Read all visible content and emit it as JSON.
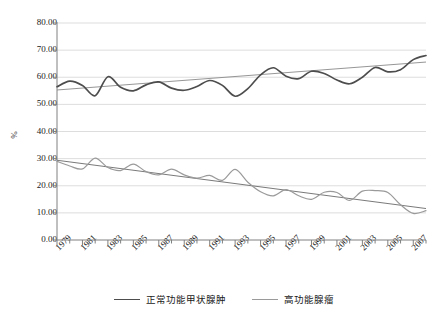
{
  "chart_data": {
    "type": "line",
    "title": "",
    "xlabel": "",
    "ylabel": "%",
    "ylim": [
      0,
      80
    ],
    "ytick_step": 10,
    "ytick_labels": [
      "0.00",
      "10.00",
      "20.00",
      "30.00",
      "40.00",
      "50.00",
      "60.00",
      "70.00",
      "80.00"
    ],
    "ytick_values": [
      0,
      10,
      20,
      30,
      40,
      50,
      60,
      70,
      80
    ],
    "xlim": [
      1979,
      2008
    ],
    "xtick_labels": [
      "1979",
      "1981",
      "1983",
      "1985",
      "1987",
      "1989",
      "1991",
      "1993",
      "1995",
      "1997",
      "1999",
      "2001",
      "2003",
      "2005",
      "2007"
    ],
    "xtick_values": [
      1979,
      1981,
      1983,
      1985,
      1987,
      1989,
      1991,
      1993,
      1995,
      1997,
      1999,
      2001,
      2003,
      2005,
      2007
    ],
    "x_minor_tick_step": 1,
    "grid": "horizontal",
    "legend_position": "bottom",
    "x": [
      1979,
      1980,
      1981,
      1982,
      1983,
      1984,
      1985,
      1986,
      1987,
      1988,
      1989,
      1990,
      1991,
      1992,
      1993,
      1994,
      1995,
      1996,
      1997,
      1998,
      1999,
      2000,
      2001,
      2002,
      2003,
      2004,
      2005,
      2006,
      2007,
      2008
    ],
    "series": [
      {
        "name": "正常功能甲状腺肿",
        "color": "#4d4d4d",
        "values": [
          56.5,
          58.6,
          57.0,
          53.2,
          60.2,
          56.3,
          55.0,
          57.2,
          58.3,
          56.0,
          55.2,
          56.6,
          58.8,
          57.0,
          53.0,
          55.8,
          60.9,
          63.5,
          60.4,
          59.5,
          62.2,
          61.4,
          59.0,
          57.6,
          60.0,
          63.6,
          62.0,
          62.8,
          66.5,
          68.0
        ],
        "trend": {
          "start": 55.3,
          "end": 65.6,
          "color": "#8a8a8a"
        }
      },
      {
        "name": "高功能腺瘤",
        "color": "#9a9a9a",
        "values": [
          29.0,
          27.3,
          26.2,
          30.2,
          26.7,
          25.6,
          28.0,
          25.2,
          24.0,
          26.1,
          24.0,
          22.8,
          23.8,
          22.0,
          26.0,
          21.3,
          17.8,
          16.3,
          18.6,
          16.3,
          15.0,
          17.6,
          17.5,
          14.6,
          18.0,
          18.2,
          17.5,
          13.0,
          9.8,
          10.8
        ],
        "trend": {
          "start": 29.4,
          "end": 11.6,
          "color": "#6a6a6a"
        }
      }
    ]
  },
  "legend": {
    "items": [
      {
        "label": "正常功能甲状腺肿",
        "color": "#4d4d4d"
      },
      {
        "label": "高功能腺瘤",
        "color": "#9a9a9a"
      }
    ]
  },
  "axes": {
    "y_title": "%"
  }
}
